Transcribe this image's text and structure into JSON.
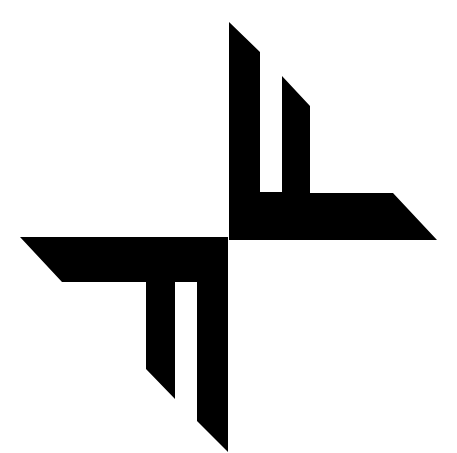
{
  "figure": {
    "background": "#ffffff",
    "foreground": "#000000",
    "icon": "geometric-pinwheel-logo-icon"
  }
}
